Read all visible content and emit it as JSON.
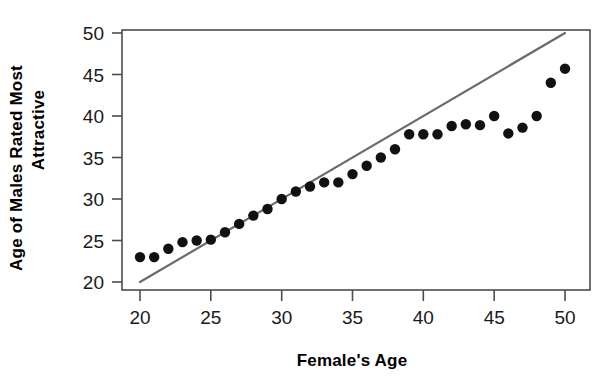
{
  "chart_data": {
    "type": "scatter",
    "title": "",
    "xlabel": "Female's Age",
    "ylabel": "Age of Males Rated Most Attractive",
    "ylabel_line1": "Age of Males Rated Most",
    "ylabel_line2": "Attractive",
    "xlim": [
      19,
      51
    ],
    "ylim": [
      18.5,
      51.5
    ],
    "xticks": [
      20,
      25,
      30,
      35,
      40,
      45,
      50
    ],
    "yticks": [
      20,
      25,
      30,
      35,
      40,
      45,
      50
    ],
    "xtick_labels": [
      "20",
      "25",
      "30",
      "35",
      "40",
      "45",
      "50"
    ],
    "ytick_labels": [
      "20",
      "25",
      "30",
      "35",
      "40",
      "45",
      "50"
    ],
    "grid": false,
    "legend": "none",
    "point_color": "#111111",
    "point_radius": 5.2,
    "series": [
      {
        "name": "Age of males rated most attractive",
        "marker": "filled-circle",
        "x": [
          20,
          21,
          22,
          23,
          24,
          25,
          26,
          27,
          28,
          29,
          30,
          31,
          32,
          33,
          34,
          35,
          36,
          37,
          38,
          39,
          40,
          41,
          42,
          43,
          44,
          45,
          46,
          47,
          48,
          49,
          50
        ],
        "y": [
          23,
          23,
          24,
          24.8,
          25,
          25.1,
          26,
          27,
          28,
          28.8,
          30,
          30.9,
          31.5,
          32,
          32,
          33,
          34,
          35,
          36,
          37.8,
          37.8,
          37.8,
          38.8,
          39,
          38.9,
          40,
          37.9,
          38.6,
          40,
          44,
          45.7
        ]
      }
    ],
    "reference_line": {
      "name": "y = x identity line",
      "color": "#6b6b6b",
      "x": [
        20,
        50
      ],
      "y": [
        20,
        50
      ]
    }
  },
  "layout": {
    "plot_left_px": 122,
    "plot_right_px": 590,
    "plot_top_px": 30,
    "plot_bottom_px": 290
  }
}
